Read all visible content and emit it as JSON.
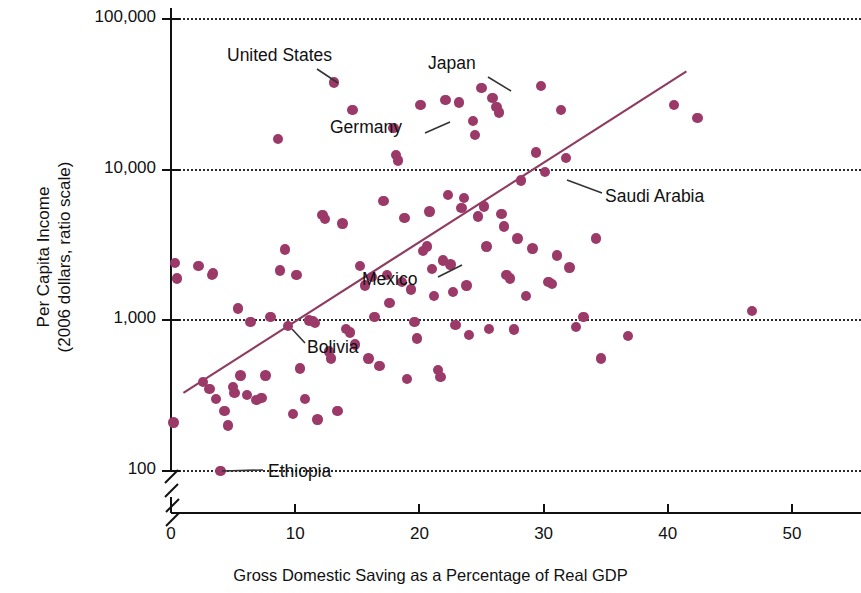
{
  "chart_data": {
    "type": "scatter",
    "title": "",
    "xlabel": "Gross Domestic Saving as a Percentage of Real GDP",
    "ylabel": "Per Capita Income\n(2006 dollars, ratio scale)",
    "ylabel_line1": "Per Capita Income",
    "ylabel_line2": "(2006 dollars, ratio scale)",
    "yscale": "log",
    "yticks": [
      100,
      1000,
      10000,
      100000
    ],
    "ytick_labels": [
      "100",
      "1,000",
      "10,000",
      "100,000"
    ],
    "ylim": [
      100,
      100000
    ],
    "xticks": [
      0,
      10,
      20,
      30,
      40,
      50
    ],
    "xtick_labels": [
      "0",
      "10",
      "20",
      "30",
      "40",
      "50"
    ],
    "xlim": [
      0,
      55
    ],
    "grid": "horizontal dotted at each decade",
    "axis_break": true,
    "legend": "none",
    "point_color": "#9B3A68",
    "line_color": "#8E3C60",
    "trendline": {
      "x0": 1.0,
      "y0": 330,
      "x1": 41.5,
      "y1": 45000
    },
    "series": [
      {
        "name": "Countries",
        "points": [
          {
            "x": 0.3,
            "y": 2400
          },
          {
            "x": 0.5,
            "y": 1900
          },
          {
            "x": 0.2,
            "y": 210
          },
          {
            "x": 2.2,
            "y": 2300
          },
          {
            "x": 3.3,
            "y": 2000
          },
          {
            "x": 3.4,
            "y": 2050
          },
          {
            "x": 2.6,
            "y": 390
          },
          {
            "x": 3.1,
            "y": 350
          },
          {
            "x": 3.6,
            "y": 300
          },
          {
            "x": 4.0,
            "y": 100
          },
          {
            "x": 4.3,
            "y": 250
          },
          {
            "x": 4.6,
            "y": 200
          },
          {
            "x": 5.0,
            "y": 360
          },
          {
            "x": 5.1,
            "y": 330
          },
          {
            "x": 5.4,
            "y": 1200
          },
          {
            "x": 5.6,
            "y": 430
          },
          {
            "x": 6.1,
            "y": 320
          },
          {
            "x": 6.4,
            "y": 980
          },
          {
            "x": 6.9,
            "y": 295
          },
          {
            "x": 7.3,
            "y": 305
          },
          {
            "x": 7.6,
            "y": 430
          },
          {
            "x": 8.0,
            "y": 1050
          },
          {
            "x": 8.6,
            "y": 16000
          },
          {
            "x": 8.8,
            "y": 2150
          },
          {
            "x": 9.2,
            "y": 2950
          },
          {
            "x": 9.4,
            "y": 920
          },
          {
            "x": 9.8,
            "y": 240
          },
          {
            "x": 10.1,
            "y": 2000
          },
          {
            "x": 10.4,
            "y": 480
          },
          {
            "x": 10.8,
            "y": 300
          },
          {
            "x": 11.1,
            "y": 1000
          },
          {
            "x": 11.4,
            "y": 990
          },
          {
            "x": 11.6,
            "y": 960
          },
          {
            "x": 11.8,
            "y": 220
          },
          {
            "x": 12.2,
            "y": 5000
          },
          {
            "x": 12.4,
            "y": 4700
          },
          {
            "x": 12.7,
            "y": 620
          },
          {
            "x": 12.9,
            "y": 560
          },
          {
            "x": 13.1,
            "y": 38000
          },
          {
            "x": 13.4,
            "y": 250
          },
          {
            "x": 13.8,
            "y": 4400
          },
          {
            "x": 14.1,
            "y": 880
          },
          {
            "x": 14.4,
            "y": 830
          },
          {
            "x": 14.6,
            "y": 25000
          },
          {
            "x": 14.8,
            "y": 690
          },
          {
            "x": 15.2,
            "y": 2300
          },
          {
            "x": 15.6,
            "y": 1700
          },
          {
            "x": 15.9,
            "y": 560
          },
          {
            "x": 16.2,
            "y": 1950
          },
          {
            "x": 16.4,
            "y": 1050
          },
          {
            "x": 16.8,
            "y": 500
          },
          {
            "x": 17.1,
            "y": 6200
          },
          {
            "x": 17.4,
            "y": 2000
          },
          {
            "x": 17.6,
            "y": 1300
          },
          {
            "x": 17.9,
            "y": 19000
          },
          {
            "x": 18.1,
            "y": 12500
          },
          {
            "x": 18.3,
            "y": 11500
          },
          {
            "x": 18.6,
            "y": 1800
          },
          {
            "x": 18.8,
            "y": 4800
          },
          {
            "x": 19.0,
            "y": 410
          },
          {
            "x": 19.3,
            "y": 1600
          },
          {
            "x": 19.6,
            "y": 980
          },
          {
            "x": 19.8,
            "y": 760
          },
          {
            "x": 20.1,
            "y": 27000
          },
          {
            "x": 20.3,
            "y": 2900
          },
          {
            "x": 20.6,
            "y": 3100
          },
          {
            "x": 20.8,
            "y": 5300
          },
          {
            "x": 21.0,
            "y": 2200
          },
          {
            "x": 21.2,
            "y": 1450
          },
          {
            "x": 21.5,
            "y": 470
          },
          {
            "x": 21.7,
            "y": 420
          },
          {
            "x": 21.9,
            "y": 2500
          },
          {
            "x": 22.1,
            "y": 29000
          },
          {
            "x": 22.3,
            "y": 6800
          },
          {
            "x": 22.5,
            "y": 2350
          },
          {
            "x": 22.7,
            "y": 1550
          },
          {
            "x": 22.9,
            "y": 930
          },
          {
            "x": 23.2,
            "y": 28000
          },
          {
            "x": 23.4,
            "y": 5600
          },
          {
            "x": 23.6,
            "y": 6500
          },
          {
            "x": 23.8,
            "y": 1700
          },
          {
            "x": 24.0,
            "y": 800
          },
          {
            "x": 24.3,
            "y": 21000
          },
          {
            "x": 24.5,
            "y": 17000
          },
          {
            "x": 24.7,
            "y": 4900
          },
          {
            "x": 25.0,
            "y": 35000
          },
          {
            "x": 25.2,
            "y": 5700
          },
          {
            "x": 25.4,
            "y": 3100
          },
          {
            "x": 25.6,
            "y": 880
          },
          {
            "x": 25.9,
            "y": 30000
          },
          {
            "x": 26.2,
            "y": 26000
          },
          {
            "x": 26.4,
            "y": 24000
          },
          {
            "x": 26.6,
            "y": 5100
          },
          {
            "x": 26.8,
            "y": 4200
          },
          {
            "x": 27.0,
            "y": 2000
          },
          {
            "x": 27.3,
            "y": 1900
          },
          {
            "x": 27.6,
            "y": 870
          },
          {
            "x": 27.9,
            "y": 3500
          },
          {
            "x": 28.2,
            "y": 8500
          },
          {
            "x": 28.6,
            "y": 1450
          },
          {
            "x": 29.1,
            "y": 3000
          },
          {
            "x": 29.4,
            "y": 13000
          },
          {
            "x": 29.8,
            "y": 36000
          },
          {
            "x": 30.1,
            "y": 9700
          },
          {
            "x": 30.4,
            "y": 1800
          },
          {
            "x": 30.7,
            "y": 1750
          },
          {
            "x": 31.1,
            "y": 2700
          },
          {
            "x": 31.4,
            "y": 25000
          },
          {
            "x": 31.8,
            "y": 12000
          },
          {
            "x": 32.1,
            "y": 2250
          },
          {
            "x": 32.6,
            "y": 900
          },
          {
            "x": 33.2,
            "y": 1050
          },
          {
            "x": 34.2,
            "y": 3500
          },
          {
            "x": 34.6,
            "y": 560
          },
          {
            "x": 36.8,
            "y": 790
          },
          {
            "x": 40.5,
            "y": 27000
          },
          {
            "x": 42.4,
            "y": 22000
          },
          {
            "x": 46.8,
            "y": 1150
          }
        ]
      }
    ],
    "annotations": [
      {
        "label": "United States",
        "x": 13.1,
        "y": 38000,
        "text_px": {
          "left": 227,
          "top": 45
        },
        "leader": {
          "x1": 317,
          "y1": 69,
          "x2": 338,
          "y2": 83
        }
      },
      {
        "label": "Japan",
        "x": 25.0,
        "y": 35000,
        "text_px": {
          "left": 428,
          "top": 53
        },
        "leader": {
          "x1": 488,
          "y1": 77,
          "x2": 511,
          "y2": 91
        }
      },
      {
        "label": "Germany",
        "x": 18.3,
        "y": 11500,
        "text_px": {
          "left": 330,
          "top": 117
        },
        "leader": {
          "x1": 425,
          "y1": 133,
          "x2": 450,
          "y2": 122
        }
      },
      {
        "label": "Saudi Arabia",
        "x": 30.1,
        "y": 9700,
        "text_px": {
          "left": 605,
          "top": 186
        },
        "leader": {
          "x1": 602,
          "y1": 193,
          "x2": 567,
          "y2": 180
        }
      },
      {
        "label": "Mexico",
        "x": 11.1,
        "y": 3100,
        "text_px": {
          "left": 362,
          "top": 269
        },
        "leader": {
          "x1": 438,
          "y1": 277,
          "x2": 462,
          "y2": 265
        }
      },
      {
        "label": "Bolivia",
        "x": 18.5,
        "y": 1000,
        "text_px": {
          "left": 307,
          "top": 337
        },
        "leader": {
          "x1": 305,
          "y1": 343,
          "x2": 292,
          "y2": 329
        }
      },
      {
        "label": "Ethiopia",
        "x": 4.0,
        "y": 100,
        "text_px": {
          "left": 268,
          "top": 461
        },
        "leader": {
          "x1": 263,
          "y1": 470,
          "x2": 222,
          "y2": 471
        }
      }
    ]
  }
}
